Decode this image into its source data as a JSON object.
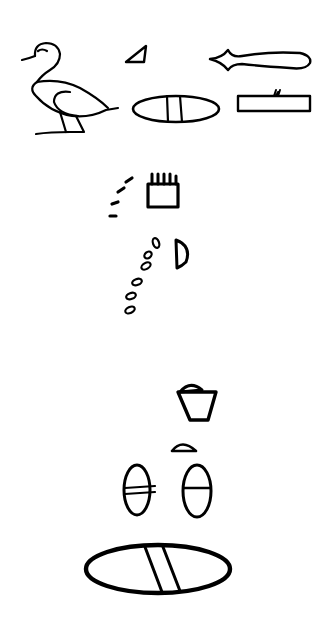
{
  "image": {
    "width": 329,
    "height": 630,
    "background": "#ffffff",
    "ink": "#000000"
  },
  "glyphs": [
    {
      "id": "duck",
      "description": "duck / pintail bird"
    },
    {
      "id": "small-triangle",
      "description": "small triangle"
    },
    {
      "id": "throw-stick",
      "description": "leaf/blade shape"
    },
    {
      "id": "oval-two-lines",
      "description": "oval with two vertical lines"
    },
    {
      "id": "bar-with-tuft",
      "description": "horizontal rectangle with small tuft"
    },
    {
      "id": "dash-arc",
      "description": "arc of dashes"
    },
    {
      "id": "comb-box",
      "description": "rectangle with teeth on top"
    },
    {
      "id": "seed-arc",
      "description": "arc of small seed shapes"
    },
    {
      "id": "half-moon",
      "description": "half-moon D shape"
    },
    {
      "id": "basket",
      "description": "basket/pot with lid"
    },
    {
      "id": "small-dome",
      "description": "small dome"
    },
    {
      "id": "oval-left",
      "description": "vertical oval with double bar"
    },
    {
      "id": "oval-right",
      "description": "vertical oval with single bar"
    },
    {
      "id": "large-oval",
      "description": "large oval with two diagonal lines"
    }
  ]
}
